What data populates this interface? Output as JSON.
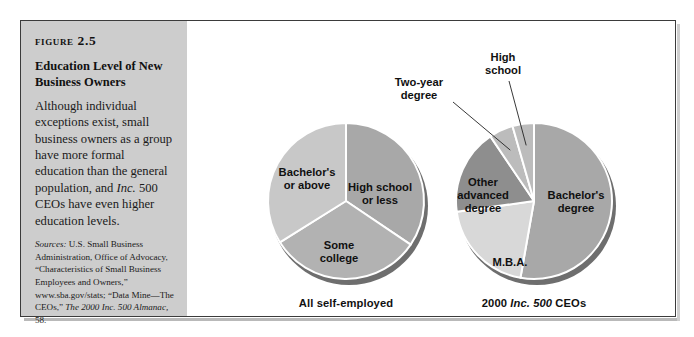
{
  "figure": {
    "number": "Figure 2.5",
    "title": "Education Level of New Business Owners",
    "body_pre": "Although individual exceptions exist, small business owners as a group have more formal education than the general population, and ",
    "body_italic": "Inc.",
    "body_post": " 500 CEOs have even higher education levels.",
    "sources_head": "Sources:",
    "sources_body": " U.S. Small Business Administration, Office of Advocacy, “Characteristics of Small Business Employees and Owners,” www.sba.gov/stats; “Data Mine—The CEOs,” ",
    "sources_last": "The 2000 Inc. 500 Almanac,",
    "sources_page": " 58."
  },
  "colors": {
    "panel_background": "#cdcdcd",
    "frame_border": "#3b3b3b",
    "page_background": "#ffffff",
    "slice_mid_gray": "#a8a8a8",
    "slice_light_gray": "#c4c4c4",
    "slice_pale_gray": "#dcdcdc",
    "slice_dark_gray": "#8e8e8e",
    "pie_shadow": "#6e6e6e",
    "slice_divider": "#ffffff",
    "label_text": "#101010"
  },
  "chart_data": [
    {
      "type": "pie",
      "title": "All self-employed",
      "caption_plain": "All self-employed",
      "center": [
        159,
        180
      ],
      "radius": 78,
      "categories": [
        "High school or less",
        "Some college",
        "Bachelor's or above"
      ],
      "values": [
        34,
        29,
        37
      ],
      "slices": [
        {
          "label": "High school\nor less",
          "value": 34,
          "start_angle": 0,
          "end_angle": 124,
          "color": "#a8a8a8",
          "label_x": 193,
          "label_y": 160,
          "label_placement": "inside"
        },
        {
          "label": "Some\ncollege",
          "value": 29,
          "start_angle": 124,
          "end_angle": 238,
          "color": "#b2b2b2",
          "label_x": 152,
          "label_y": 218,
          "label_placement": "inside"
        },
        {
          "label": "Bachelor's\nor above",
          "value": 37,
          "start_angle": 238,
          "end_angle": 360,
          "color": "#c8c8c8",
          "label_x": 120,
          "label_y": 145,
          "label_placement": "inside"
        }
      ],
      "legend": "none",
      "grid": false
    },
    {
      "type": "pie",
      "title": "2000 Inc. 500 CEOs",
      "caption_pre": "2000 ",
      "caption_italic": "Inc. 500",
      "caption_post": " CEOs",
      "center": [
        347,
        180
      ],
      "radius": 78,
      "categories": [
        "Bachelor's degree",
        "M.B.A.",
        "Other advanced degree",
        "Two-year degree",
        "High school"
      ],
      "values": [
        53,
        20,
        18,
        5,
        4
      ],
      "slices": [
        {
          "label": "Bachelor's\ndegree",
          "value": 53,
          "start_angle": 0,
          "end_angle": 190,
          "color": "#a8a8a8",
          "label_x": 389,
          "label_y": 168,
          "label_placement": "inside"
        },
        {
          "label": "M.B.A.",
          "value": 20,
          "start_angle": 190,
          "end_angle": 262,
          "color": "#d8d8d8",
          "label_x": 323,
          "label_y": 235,
          "label_placement": "inside"
        },
        {
          "label": "Other\nadvanced\ndegree",
          "value": 18,
          "start_angle": 262,
          "end_angle": 326,
          "color": "#8e8e8e",
          "label_x": 296,
          "label_y": 155,
          "label_placement": "inside"
        },
        {
          "label": "Two-year\ndegree",
          "value": 5,
          "start_angle": 326,
          "end_angle": 344,
          "color": "#bcbcbc",
          "label_x": 232,
          "label_y": 55,
          "label_placement": "callout"
        },
        {
          "label": "High\nschool",
          "value": 4,
          "start_angle": 344,
          "end_angle": 360,
          "color": "#bcbcbc",
          "label_x": 316,
          "label_y": 30,
          "label_placement": "callout"
        }
      ],
      "legend": "none",
      "grid": false
    }
  ]
}
